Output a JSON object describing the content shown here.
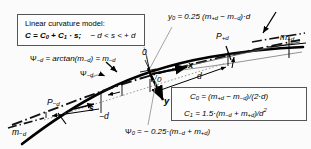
{
  "figure": {
    "background_color": "#fbfbfb",
    "ink_color": "#000000",
    "box_border_color": "#555555"
  },
  "model_box": {
    "line1": "Linear curvature model:",
    "line2_lhs": "C = C",
    "line2_sub0": "0",
    "line2_mid": " + C",
    "line2_sub1": "1",
    "line2_rhs": " · s;",
    "line2_range": "− d < s < + d"
  },
  "coefficient_box": {
    "c0_lhs": "C",
    "c0_sub": "0",
    "c0_rhs": " = (m",
    "c0_sub_pd": "+d",
    "c0_minus": " − m",
    "c0_sub_md": "−d",
    "c0_tail": ")/(2·d)",
    "c1_lhs": "C",
    "c1_sub": "1",
    "c1_rhs": " = 1.5·(m",
    "c1_sub_md": "−d",
    "c1_plus": " + m",
    "c1_sub_pd": "+d",
    "c1_tail": ")/d",
    "c1_pow": "2"
  },
  "annotations": {
    "y0_formula": {
      "lhs": "y",
      "lhs_sub": "0",
      "rhs": " = 0.25 (m",
      "sub_pd": "+d",
      "minus": " − m",
      "sub_md": "−d",
      "tail": ")·d"
    },
    "psi_md_formula": {
      "lhs": "Ψ",
      "lhs_sub": "−d",
      "mid": " = arctan(m",
      "sub_a": "−d",
      "eq": ") = m",
      "sub_b": "−d"
    },
    "psi_0_formula": {
      "lhs": "Ψ",
      "lhs_sub": "0",
      "rhs": " = − 0.25·(m",
      "sub_md": "−d",
      "plus": " + m",
      "sub_pd": "+d",
      "tail": ")"
    },
    "psi_md_arc_label": {
      "base": "Ψ",
      "sub": "−d"
    },
    "psi_0_arc_label": {
      "base": "0"
    },
    "origin_label": "0",
    "axis_x": "x",
    "axis_y": "y",
    "point_md": {
      "base": "P",
      "sub": "−d"
    },
    "point_pd": {
      "base": "P",
      "sub": "+d"
    },
    "slope_md_left": {
      "base": "m",
      "sub": "−d"
    },
    "slope_md_mid": {
      "base": "m",
      "sub": "−d"
    },
    "slope_pd_right": {
      "base": "m",
      "sub": "+d"
    },
    "dim_s": "s",
    "dim_minus_d": "−d",
    "dim_d": "d"
  }
}
